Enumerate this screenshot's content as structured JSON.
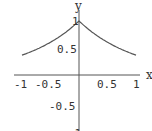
{
  "chart_data": {
    "type": "line",
    "title": "",
    "xlabel": "x",
    "ylabel": "y",
    "function": "y = e^(-|x|)",
    "xlim": [
      -1,
      1
    ],
    "ylim": [
      -1,
      1
    ],
    "grid": false,
    "x_ticks": [
      "-1",
      "-0.5",
      "0.5",
      "1"
    ],
    "y_ticks": [
      "1",
      "0.5",
      "-0.5",
      "-1"
    ],
    "series": [
      {
        "name": "exp(-|x|)",
        "x": [
          -1,
          -0.75,
          -0.5,
          -0.25,
          0,
          0.25,
          0.5,
          0.75,
          1
        ],
        "values": [
          0.368,
          0.472,
          0.607,
          0.779,
          1.0,
          0.779,
          0.607,
          0.472,
          0.368
        ]
      }
    ],
    "colors": {
      "curve": "#555555",
      "axis": "#555555"
    }
  }
}
